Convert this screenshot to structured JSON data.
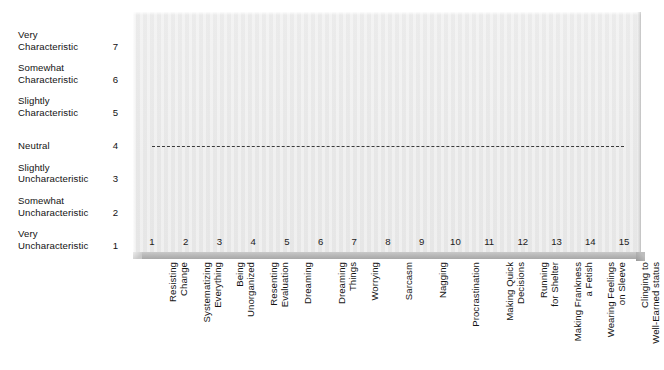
{
  "chart_data": {
    "type": "line",
    "title": "",
    "xlabel": "",
    "ylabel": "",
    "ylim": [
      1,
      7
    ],
    "grid": false,
    "legend": "none",
    "y_scale": [
      {
        "value": 7,
        "label": "Very\nCharacteristic",
        "lines": 2
      },
      {
        "value": 6,
        "label": "Somewhat\nCharacteristic",
        "lines": 2
      },
      {
        "value": 5,
        "label": "Slightly\nCharacteristic",
        "lines": 2
      },
      {
        "value": 4,
        "label": "Neutral",
        "lines": 1
      },
      {
        "value": 3,
        "label": "Slightly\nUncharacteristic",
        "lines": 2
      },
      {
        "value": 2,
        "label": "Somewhat\nUncharacteristic",
        "lines": 2
      },
      {
        "value": 1,
        "label": "Very\nUncharacteristic",
        "lines": 2
      }
    ],
    "x_ticks": [
      "1",
      "2",
      "3",
      "4",
      "5",
      "6",
      "7",
      "8",
      "9",
      "10",
      "11",
      "12",
      "13",
      "14",
      "15"
    ],
    "categories": [
      "Resisting\nChange",
      "Systematizing\nEverything",
      "Being\nUnorganized",
      "Resenting\nEvaluation",
      "Dreaming",
      "Dreaming\nThings",
      "Worrying",
      "Sarcasm",
      "Nagging",
      "Procrastination",
      "Making Quick\nDecisions",
      "Running\nfor Shelter",
      "Making Frankness\na Fetish",
      "Wearing Feelings\non Sleeve",
      "Clinging to\nWell-Earned status"
    ],
    "series": [
      {
        "name": "Neutral reference",
        "style": "dashed",
        "color": "#3b3b3b",
        "values": [
          4,
          4,
          4,
          4,
          4,
          4,
          4,
          4,
          4,
          4,
          4,
          4,
          4,
          4,
          4
        ]
      }
    ],
    "annotations": []
  },
  "colors": {
    "plot_background": "#ececec",
    "page_background": "#ffffff",
    "reference_line": "#3b3b3b",
    "axis_base": "#b6b6b6",
    "text": "#141414"
  }
}
